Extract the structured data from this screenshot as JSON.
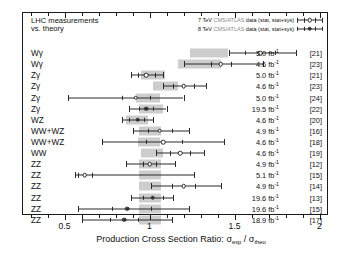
{
  "header": {
    "line1": "LHC measurements",
    "line2": "vs. theory"
  },
  "legend": {
    "entries": [
      {
        "energy": "7 TeV",
        "experiment": "CMS/ATLAS",
        "rest": "data (stat, stat+sys)",
        "marker": "open-circle"
      },
      {
        "energy": "8 TeV",
        "experiment": "CMS/ATLAS",
        "rest": "data (stat, stat+sys)",
        "marker": "filled-circle"
      }
    ]
  },
  "axis": {
    "title_prefix": "Production Cross Section Ratio: ",
    "title_num": "σ",
    "title_num_sub": "exp",
    "title_sep": " / ",
    "title_den": "σ",
    "title_den_sub": "theo",
    "ticks": [
      "0.5",
      "1",
      "1.5",
      "2"
    ],
    "min": 0.25,
    "max": 2.05
  },
  "colors": {
    "band": "#cdcdcd",
    "marker_open_fill": "#ffffff",
    "marker_filled": "#333333",
    "line": "#2a2a2a",
    "frame": "#1a1a1a",
    "text": "#111111",
    "legend_dim": "#8a8a8a"
  },
  "chart_data": {
    "type": "scatter",
    "title": "LHC measurements vs. theory",
    "xlabel": "Production Cross Section Ratio: σ_exp / σ_theo",
    "ylabel": "",
    "xlim": [
      0.25,
      2.05
    ],
    "grid": false,
    "legend_position": "top-right",
    "columns": [
      "channel",
      "ratio",
      "stat_lo",
      "stat_hi",
      "sys_lo",
      "sys_hi",
      "band_lo",
      "band_hi",
      "energy",
      "luminosity",
      "reference"
    ],
    "rows": [
      {
        "channel": "Wγ",
        "ratio": 1.65,
        "stat_lo": 1.56,
        "stat_hi": 1.74,
        "sys_lo": 1.47,
        "sys_hi": 1.86,
        "band_lo": 1.24,
        "band_hi": 1.46,
        "energy": "7 TeV",
        "luminosity": "5.0",
        "lumi_unit": "fb",
        "reference": "[21]"
      },
      {
        "channel": "Wγ",
        "ratio": 1.42,
        "stat_lo": 1.36,
        "stat_hi": 1.48,
        "sys_lo": 1.2,
        "sys_hi": 1.67,
        "band_lo": 1.17,
        "band_hi": 1.42,
        "energy": "7 TeV",
        "luminosity": "4.6",
        "lumi_unit": "fb",
        "reference": "[23]"
      },
      {
        "channel": "Zγ",
        "ratio": 0.98,
        "stat_lo": 0.93,
        "stat_hi": 1.03,
        "sys_lo": 0.89,
        "sys_hi": 1.08,
        "band_lo": 0.95,
        "band_hi": 1.09,
        "energy": "7 TeV",
        "luminosity": "5.0",
        "lumi_unit": "fb",
        "reference": "[21]"
      },
      {
        "channel": "Zγ",
        "ratio": 1.2,
        "stat_lo": 1.14,
        "stat_hi": 1.26,
        "sys_lo": 1.08,
        "sys_hi": 1.33,
        "band_lo": 1.02,
        "band_hi": 1.17,
        "energy": "7 TeV",
        "luminosity": "4.6",
        "lumi_unit": "fb",
        "reference": "[23]"
      },
      {
        "channel": "Zγ",
        "ratio": 0.92,
        "stat_lo": 0.84,
        "stat_hi": 1.0,
        "sys_lo": 0.52,
        "sys_hi": 1.2,
        "band_lo": 0.92,
        "band_hi": 1.06,
        "energy": "7 TeV",
        "luminosity": "5.0",
        "lumi_unit": "fb",
        "reference": "[24]"
      },
      {
        "channel": "Zγ",
        "ratio": 0.98,
        "stat_lo": 0.94,
        "stat_hi": 1.02,
        "sys_lo": 0.88,
        "sys_hi": 1.1,
        "band_lo": 0.94,
        "band_hi": 1.08,
        "energy": "8 TeV",
        "luminosity": "19.5",
        "lumi_unit": "fb",
        "reference": "[22]"
      },
      {
        "channel": "WZ",
        "ratio": 0.93,
        "stat_lo": 0.88,
        "stat_hi": 0.97,
        "sys_lo": 0.84,
        "sys_hi": 1.02,
        "band_lo": 0.86,
        "band_hi": 0.99,
        "energy": "8 TeV",
        "luminosity": "4.6",
        "lumi_unit": "fb",
        "reference": "[20]"
      },
      {
        "channel": "WW+WZ",
        "ratio": 1.06,
        "stat_lo": 0.99,
        "stat_hi": 1.13,
        "sys_lo": 0.9,
        "sys_hi": 1.23,
        "band_lo": 0.94,
        "band_hi": 1.07,
        "energy": "7 TeV",
        "luminosity": "4.9",
        "lumi_unit": "fb",
        "reference": "[16]"
      },
      {
        "channel": "WW+WZ",
        "ratio": 1.08,
        "stat_lo": 0.98,
        "stat_hi": 1.19,
        "sys_lo": 0.72,
        "sys_hi": 1.44,
        "band_lo": 0.93,
        "band_hi": 1.06,
        "energy": "7 TeV",
        "luminosity": "4.6",
        "lumi_unit": "fb",
        "reference": "[18]"
      },
      {
        "channel": "WW",
        "ratio": 1.18,
        "stat_lo": 1.12,
        "stat_hi": 1.24,
        "sys_lo": 1.04,
        "sys_hi": 1.32,
        "band_lo": 0.95,
        "band_hi": 1.08,
        "energy": "7 TeV",
        "luminosity": "4.6",
        "lumi_unit": "fb",
        "reference": "[19]"
      },
      {
        "channel": "ZZ",
        "ratio": 1.0,
        "stat_lo": 0.96,
        "stat_hi": 1.04,
        "sys_lo": 0.86,
        "sys_hi": 1.15,
        "band_lo": 0.94,
        "band_hi": 1.07,
        "energy": "7 TeV",
        "luminosity": "4.9",
        "lumi_unit": "fb",
        "reference": "[12]"
      },
      {
        "channel": "ZZ",
        "ratio": 0.62,
        "stat_lo": 0.58,
        "stat_hi": 0.66,
        "sys_lo": 0.56,
        "sys_hi": 1.26,
        "band_lo": 0.94,
        "band_hi": 1.07,
        "energy": "7 TeV",
        "luminosity": "5.1",
        "lumi_unit": "fb",
        "reference": "[15]"
      },
      {
        "channel": "ZZ",
        "ratio": 1.2,
        "stat_lo": 1.13,
        "stat_hi": 1.27,
        "sys_lo": 1.01,
        "sys_hi": 1.42,
        "band_lo": 0.94,
        "band_hi": 1.07,
        "energy": "7 TeV",
        "luminosity": "4.9",
        "lumi_unit": "fb",
        "reference": "[14]"
      },
      {
        "channel": "ZZ",
        "ratio": 1.02,
        "stat_lo": 0.96,
        "stat_hi": 1.08,
        "sys_lo": 0.89,
        "sys_hi": 1.14,
        "band_lo": 0.94,
        "band_hi": 1.07,
        "energy": "8 TeV",
        "luminosity": "19.6",
        "lumi_unit": "fb",
        "reference": "[13]"
      },
      {
        "channel": "ZZ",
        "ratio": 0.87,
        "stat_lo": 0.78,
        "stat_hi": 1.01,
        "sys_lo": 0.58,
        "sys_hi": 1.23,
        "band_lo": 0.94,
        "band_hi": 1.07,
        "energy": "8 TeV",
        "luminosity": "19.6",
        "lumi_unit": "fb",
        "reference": "[15]"
      },
      {
        "channel": "ZZ",
        "ratio": 0.85,
        "stat_lo": 0.77,
        "stat_hi": 0.93,
        "sys_lo": 0.6,
        "sys_hi": 1.13,
        "band_lo": 0.94,
        "band_hi": 1.07,
        "energy": "8 TeV",
        "luminosity": "18.9",
        "lumi_unit": "fb",
        "reference": "[17]"
      }
    ]
  }
}
